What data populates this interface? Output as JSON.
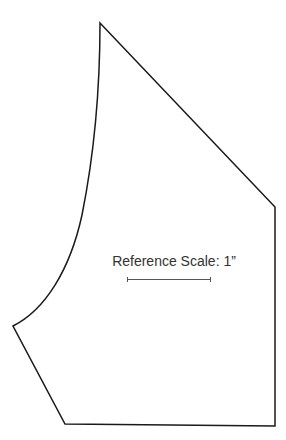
{
  "diagram": {
    "type": "sewing-pattern-piece",
    "stroke_color": "#1a1a1a",
    "scale_label": "Reference Scale: 1”",
    "scale_bar_color": "#555555"
  }
}
